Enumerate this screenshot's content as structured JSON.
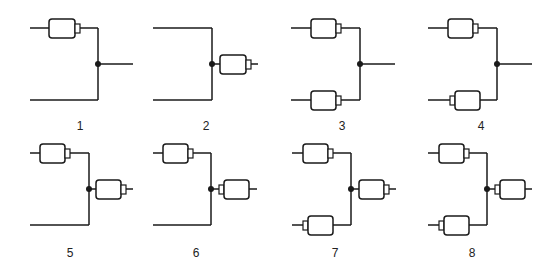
{
  "diagrams": [
    {
      "label": "1",
      "label_pos": [
        80,
        126
      ],
      "top": "wire",
      "bottom": "wire",
      "output": "wire",
      "top_flip": false,
      "bottom_flip": false,
      "output_flip": false
    },
    {
      "label": "2",
      "label_pos": [
        206,
        126
      ],
      "top": "wire",
      "bottom": "wire",
      "output": "connector",
      "top_flip": false,
      "bottom_flip": false,
      "output_flip": false
    },
    {
      "label": "3",
      "label_pos": [
        342,
        126
      ],
      "top": "connector",
      "bottom": "connector",
      "output": "wire",
      "top_flip": false,
      "bottom_flip": false,
      "output_flip": false
    },
    {
      "label": "4",
      "label_pos": [
        481,
        126
      ],
      "top": "connector",
      "bottom": "connector",
      "output": "wire",
      "top_flip": false,
      "bottom_flip": true,
      "output_flip": false
    },
    {
      "label": "5",
      "label_pos": [
        70,
        253
      ],
      "top": "connector",
      "bottom": "wire",
      "output": "connector",
      "top_flip": false,
      "bottom_flip": false,
      "output_flip": false
    },
    {
      "label": "6",
      "label_pos": [
        196,
        253
      ],
      "top": "connector",
      "bottom": "wire",
      "output": "connector",
      "top_flip": false,
      "bottom_flip": false,
      "output_flip": true
    },
    {
      "label": "7",
      "label_pos": [
        335,
        253
      ],
      "top": "connector",
      "bottom": "connector",
      "output": "connector",
      "top_flip": false,
      "bottom_flip": true,
      "output_flip": false
    },
    {
      "label": "8",
      "label_pos": [
        472,
        253
      ],
      "top": "connector",
      "bottom": "connector",
      "output": "connector",
      "top_flip": false,
      "bottom_flip": true,
      "output_flip": true
    }
  ],
  "colors": {
    "line": "#1a1a1a",
    "box_fill": "#ffffff"
  }
}
